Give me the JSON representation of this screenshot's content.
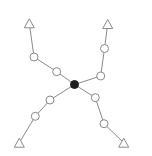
{
  "canvas": {
    "width": 152,
    "height": 156,
    "background": "#ffffff"
  },
  "colors": {
    "edge": "#8a8a8a",
    "node_stroke": "#8a8a8a",
    "node_fill": "#ffffff",
    "center_fill": "#1e1e1e"
  },
  "center": {
    "id": "center",
    "shape": "filled-circle",
    "x": 74.5,
    "y": 84.5,
    "r": 4
  },
  "branches": [
    {
      "name": "top-left",
      "nodes": [
        {
          "shape": "circle",
          "x": 56.7,
          "y": 71.7,
          "r": 4
        },
        {
          "shape": "circle",
          "x": 34,
          "y": 57,
          "r": 4
        },
        {
          "shape": "triangle",
          "x": 29.3,
          "y": 23.3,
          "size": 10
        }
      ]
    },
    {
      "name": "top-right",
      "nodes": [
        {
          "shape": "circle",
          "x": 100.7,
          "y": 76,
          "r": 4
        },
        {
          "shape": "circle",
          "x": 104.5,
          "y": 48.5,
          "r": 4
        },
        {
          "shape": "triangle",
          "x": 107.7,
          "y": 24,
          "size": 10
        }
      ]
    },
    {
      "name": "bottom-left",
      "nodes": [
        {
          "shape": "circle",
          "x": 50,
          "y": 100,
          "r": 4
        },
        {
          "shape": "circle",
          "x": 35.3,
          "y": 116.3,
          "r": 4
        },
        {
          "shape": "triangle",
          "x": 19.3,
          "y": 142.7,
          "size": 10
        }
      ]
    },
    {
      "name": "bottom-right",
      "nodes": [
        {
          "shape": "circle",
          "x": 95.3,
          "y": 97.7,
          "r": 4
        },
        {
          "shape": "circle",
          "x": 104,
          "y": 123.7,
          "r": 4
        },
        {
          "shape": "triangle",
          "x": 123.7,
          "y": 142.7,
          "size": 10
        }
      ]
    }
  ]
}
